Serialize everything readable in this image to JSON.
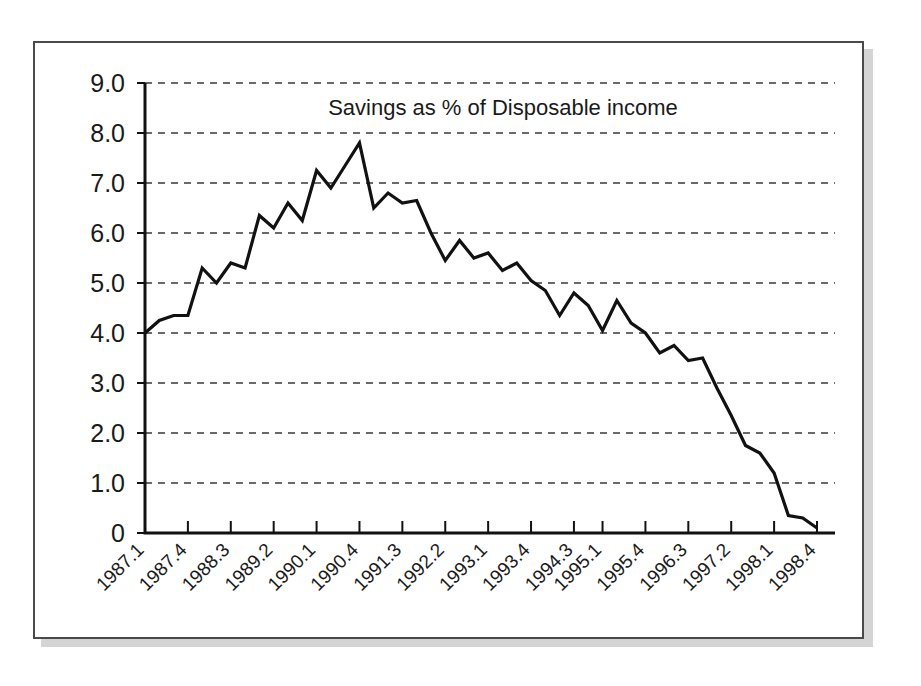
{
  "chart_data": {
    "type": "line",
    "title": "Savings as % of Disposable income",
    "xlabel": "",
    "ylabel": "",
    "ylim": [
      0,
      9
    ],
    "grid": true,
    "legend": false,
    "ytick_labels": [
      "9.0",
      "8.0",
      "7.0",
      "6.0",
      "5.0",
      "4.0",
      "3.0",
      "2.0",
      "1.0",
      "0"
    ],
    "ytick_values": [
      9.0,
      8.0,
      7.0,
      6.0,
      5.0,
      4.0,
      3.0,
      2.0,
      1.0,
      0
    ],
    "xtick_labels": [
      "1987.1",
      "1987.4",
      "1988.3",
      "1989.2",
      "1990.1",
      "1990.4",
      "1991.3",
      "1992.2",
      "1993.1",
      "1993.4",
      "1994.3",
      "1995.1",
      "1995.4",
      "1996.3",
      "1997.2",
      "1998.1",
      "1998.4"
    ],
    "xtick_indices": [
      0,
      3,
      6,
      9,
      12,
      15,
      18,
      21,
      24,
      27,
      30,
      32,
      35,
      38,
      41,
      44,
      47
    ],
    "x": [
      "1987.1",
      "1987.2",
      "1987.3",
      "1987.4",
      "1988.1",
      "1988.2",
      "1988.3",
      "1988.4",
      "1989.1",
      "1989.2",
      "1989.3",
      "1989.4",
      "1990.1",
      "1990.2",
      "1990.3",
      "1990.4",
      "1991.1",
      "1991.2",
      "1991.3",
      "1991.4",
      "1992.1",
      "1992.2",
      "1992.3",
      "1992.4",
      "1993.1",
      "1993.2",
      "1993.3",
      "1993.4",
      "1994.1",
      "1994.2",
      "1994.3",
      "1994.4",
      "1995.1",
      "1995.2",
      "1995.3",
      "1995.4",
      "1996.1",
      "1996.2",
      "1996.3",
      "1996.4",
      "1997.1",
      "1997.2",
      "1997.3",
      "1997.4",
      "1998.1",
      "1998.2",
      "1998.3",
      "1998.4"
    ],
    "series": [
      {
        "name": "Savings as % of Disposable income",
        "color": "#111111",
        "values": [
          4.0,
          4.25,
          4.35,
          4.35,
          5.3,
          5.0,
          5.4,
          5.3,
          6.35,
          6.1,
          6.6,
          6.25,
          7.25,
          6.9,
          7.35,
          7.8,
          6.5,
          6.8,
          6.6,
          6.65,
          6.0,
          5.45,
          5.85,
          5.5,
          5.6,
          5.25,
          5.4,
          5.05,
          4.85,
          4.35,
          4.8,
          4.55,
          4.05,
          4.65,
          4.2,
          4.0,
          3.6,
          3.75,
          3.45,
          3.5,
          2.9,
          2.35,
          1.75,
          1.6,
          1.2,
          0.35,
          0.3,
          0.1
        ]
      }
    ]
  }
}
